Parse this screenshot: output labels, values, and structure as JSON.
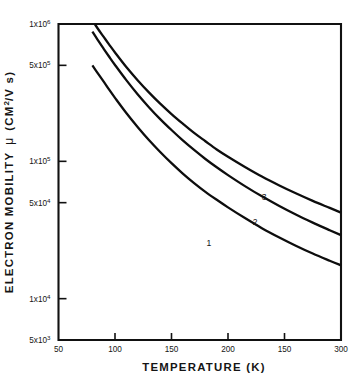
{
  "chart_data": {
    "type": "line",
    "title": "",
    "xlabel": "TEMPERATURE   (K)",
    "ylabel": "ELECTRON MOBILITY  μ  (CM²/V s)",
    "xscale": "linear",
    "yscale": "log",
    "xlim": [
      50,
      300
    ],
    "ylim": [
      5000,
      1000000
    ],
    "grid": false,
    "legend_position": "inline-curve-labels",
    "xticks": [
      {
        "value": 50,
        "label": "50"
      },
      {
        "value": 100,
        "label": "100"
      },
      {
        "value": 150,
        "label": "150"
      },
      {
        "value": 200,
        "label": "200"
      },
      {
        "value": 250,
        "label": "150"
      },
      {
        "value": 300,
        "label": "300"
      }
    ],
    "yticks": [
      {
        "value": 1000000,
        "mantissa": "1x10",
        "exponent": "6"
      },
      {
        "value": 500000,
        "mantissa": "5x10",
        "exponent": "5"
      },
      {
        "value": 100000,
        "mantissa": "1x10",
        "exponent": "5"
      },
      {
        "value": 50000,
        "mantissa": "5x10",
        "exponent": "4"
      },
      {
        "value": 10000,
        "mantissa": "1x10",
        "exponent": "4"
      },
      {
        "value": 5000,
        "mantissa": "5x10",
        "exponent": "3"
      }
    ],
    "series": [
      {
        "name": "1",
        "label": "1",
        "label_x": 183,
        "label_y": 24000,
        "color": "#0d0d0d",
        "x": [
          80,
          85,
          90,
          95,
          100,
          110,
          120,
          130,
          140,
          150,
          160,
          170,
          180,
          190,
          200,
          215,
          230,
          245,
          260,
          275,
          290,
          300
        ],
        "y": [
          500000,
          435000,
          380000,
          331000,
          290000,
          225000,
          178000,
          143000,
          117000,
          97000,
          81500,
          69500,
          60000,
          52500,
          46200,
          38600,
          32600,
          28000,
          24300,
          21300,
          18900,
          17500
        ]
      },
      {
        "name": "2",
        "label": "2",
        "label_x": 224,
        "label_y": 34500,
        "color": "#0d0d0d",
        "x": [
          80,
          85,
          90,
          95,
          100,
          110,
          120,
          130,
          140,
          150,
          160,
          170,
          180,
          190,
          200,
          215,
          230,
          245,
          260,
          275,
          290,
          300
        ],
        "y": [
          880000,
          760000,
          660000,
          575000,
          503000,
          390000,
          308000,
          248000,
          203000,
          169000,
          142000,
          121000,
          104000,
          90500,
          79400,
          66000,
          55600,
          47500,
          41000,
          35800,
          31500,
          29000
        ]
      },
      {
        "name": "3",
        "label": "3",
        "label_x": 232,
        "label_y": 52000,
        "color": "#0d0d0d",
        "x": [
          80,
          85,
          90,
          95,
          100,
          110,
          120,
          130,
          140,
          150,
          160,
          170,
          180,
          190,
          200,
          215,
          230,
          245,
          260,
          275,
          290,
          300
        ],
        "y": [
          1060000,
          920000,
          805000,
          705000,
          620000,
          486000,
          390000,
          318000,
          263000,
          221000,
          188000,
          161000,
          140000,
          122000,
          108000,
          91000,
          77500,
          67000,
          58500,
          51500,
          45800,
          42300
        ]
      }
    ]
  },
  "axes": {
    "x_title": "TEMPERATURE   (K)",
    "y_title_main": "ELECTRON MOBILITY",
    "y_title_mu": "μ",
    "y_title_units_pre": "(CM",
    "y_title_units_sup": "2",
    "y_title_units_post": "/V s)"
  },
  "colors": {
    "axis": "#111111",
    "curve": "#0d0d0d",
    "background": "#ffffff",
    "text": "#151515"
  }
}
